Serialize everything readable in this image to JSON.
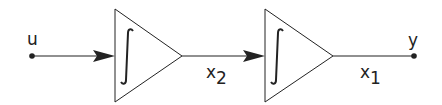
{
  "diagram": {
    "type": "block-diagram",
    "colors": {
      "stroke": "#222222",
      "background": "#ffffff"
    },
    "input": {
      "label": "u"
    },
    "blocks": [
      {
        "id": "integrator-1",
        "symbol": "∫",
        "shape": "triangle"
      },
      {
        "id": "integrator-2",
        "symbol": "∫",
        "shape": "triangle"
      }
    ],
    "signals": [
      {
        "from": "u",
        "to": "integrator-1",
        "label": ""
      },
      {
        "from": "integrator-1",
        "to": "integrator-2",
        "label_base": "x",
        "label_sub": "2"
      },
      {
        "from": "integrator-2",
        "to": "y",
        "label_base": "x",
        "label_sub": "1"
      }
    ],
    "output": {
      "label": "y"
    }
  }
}
